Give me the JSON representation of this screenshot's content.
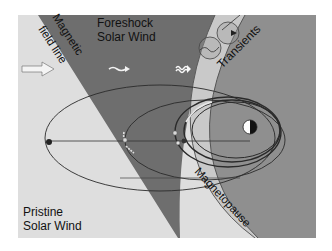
{
  "diagram": {
    "labels": {
      "magnetic_field_line_1": "Magnetic",
      "magnetic_field_line_2": "field line",
      "foreshock_1": "Foreshock",
      "foreshock_2": "Solar Wind",
      "transients": "Transients",
      "pristine_1": "Pristine",
      "pristine_2": "Solar Wind",
      "magnetopause": "Magnetopause"
    },
    "colors": {
      "frame": "#ffffff",
      "pristine_region": "#dedede",
      "foreshock_region": "#6e6e6e",
      "magnetosheath_band": "#c9c9c9",
      "magnetosphere_region": "#8f8f8f",
      "orbit_line": "#2a2a2a",
      "text": "#111111"
    },
    "icons": [
      "solar-wind-arrow-icon",
      "wavy-arrow-icon",
      "compressed-wavy-arrow-icon",
      "transient-bubble-icon",
      "earth-icon",
      "spacecraft-marker-icon"
    ]
  }
}
